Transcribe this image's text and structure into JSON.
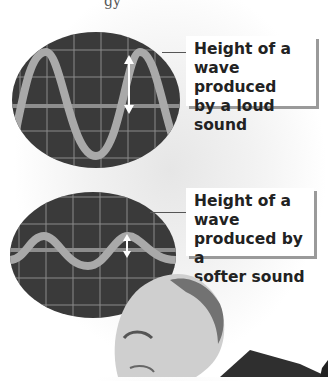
{
  "header": {
    "fragment": "gy"
  },
  "diagrams": [
    {
      "name": "loud",
      "label": "Height of a wave produced by a loud sound",
      "label_lines": [
        "Height of a",
        "wave produced",
        "by a loud sound"
      ],
      "amplitude": "large"
    },
    {
      "name": "soft",
      "label": "Height of a wave produced by a softer sound",
      "label_lines": [
        "Height of a wave",
        "produced by a",
        "softer sound"
      ],
      "amplitude": "small"
    }
  ],
  "colors": {
    "screen": "#3a3a3a",
    "grid": "#8a8a8a",
    "wave": "#a9a9a9",
    "arrow": "#ffffff",
    "label_shadow": "#9a9a9a"
  }
}
